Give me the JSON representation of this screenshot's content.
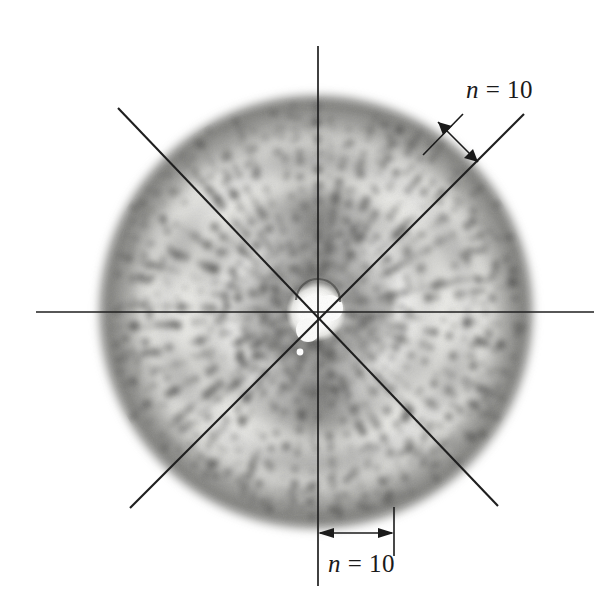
{
  "figure": {
    "kind": "laue-x-ray-diffraction-pattern",
    "background_color": "#ffffff",
    "ink_color": "#1a1a1a",
    "film_tone_light": "#f6f6f4",
    "film_tone_mid": "#b9b9b6",
    "film_tone_dark": "#6e6e6c",
    "spot_color": "#595957"
  },
  "annotations": {
    "upper_right": {
      "variable": "n",
      "equals": " = ",
      "value": "10",
      "full_text": "n = 10"
    },
    "bottom": {
      "variable": "n",
      "equals": " = ",
      "value": "10",
      "full_text": "n = 10"
    }
  },
  "geometry": {
    "center_x": 316,
    "center_y": 312,
    "disc_radius": 216,
    "beamstop_radius": 17,
    "horizontal_axis": {
      "x1": 36,
      "y1": 312,
      "x2": 594,
      "y2": 312
    },
    "vertical_axis": {
      "x1": 318,
      "y1": 46,
      "x2": 318,
      "y2": 586
    },
    "diagonal_nw_se": {
      "x1": 118,
      "y1": 108,
      "x2": 498,
      "y2": 506
    },
    "diagonal_sw_ne": {
      "x1": 130,
      "y1": 508,
      "x2": 524,
      "y2": 114
    }
  },
  "chart_data": {
    "type": "scatter",
    "title": "",
    "xlabel": "",
    "ylabel": "",
    "grid": false,
    "legend_position": "none",
    "annotations": [
      "n = 10",
      "n = 10"
    ],
    "reference_lines": [
      {
        "name": "horizontal",
        "angle_deg": 0
      },
      {
        "name": "vertical",
        "angle_deg": 90
      },
      {
        "name": "diagonal-nw-se",
        "angle_deg": -45
      },
      {
        "name": "diagonal-sw-ne",
        "angle_deg": 45
      }
    ],
    "spot_count_per_interval": 10,
    "diffuse_rings_radii": [
      62,
      104,
      148,
      188,
      212
    ]
  }
}
